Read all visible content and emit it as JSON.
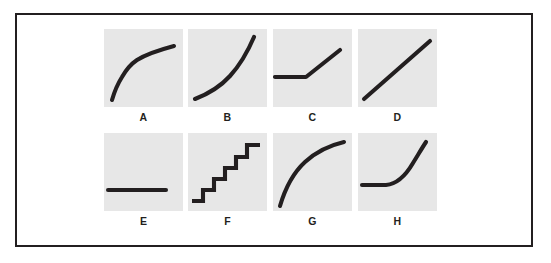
{
  "figure": {
    "background_color": "#ffffff",
    "frame_color": "#231f20",
    "panel_color": "#e7e7e7",
    "curve_color": "#231f20",
    "rows": 2,
    "columns": 4
  },
  "chart_data": {
    "type": "line",
    "title": "",
    "xlabel": "",
    "ylabel": "",
    "grid": false,
    "legend": "none",
    "panels": [
      {
        "id": "A",
        "label": "A",
        "shape": "concave-increasing-with-knee",
        "description": "Rises steeply from lower left, bends at a knee, then flattens toward the upper right.",
        "path": "M 8,71 C 10,64 13,56 18,48 C 22,41 27,35 33,31 C 41,26 55,21 70,17",
        "points": [
          [
            8,
            71
          ],
          [
            18,
            48
          ],
          [
            33,
            31
          ],
          [
            50,
            23
          ],
          [
            70,
            17
          ]
        ]
      },
      {
        "id": "B",
        "label": "B",
        "shape": "convex-exponential",
        "description": "Exponential growth: nearly flat at the lower left then sweeping sharply upward at the right.",
        "path": "M 7,70 C 20,65 32,58 42,47 C 52,36 60,22 66,8",
        "points": [
          [
            7,
            70
          ],
          [
            24,
            63
          ],
          [
            42,
            47
          ],
          [
            56,
            29
          ],
          [
            66,
            8
          ]
        ]
      },
      {
        "id": "C",
        "label": "C",
        "shape": "piecewise-hockey-stick",
        "description": "A flat horizontal segment that breaks into a straight rising diagonal: a hockey-stick kink.",
        "path": "M 2,48 L 33,48 L 67,21",
        "points": [
          [
            2,
            48
          ],
          [
            33,
            48
          ],
          [
            67,
            21
          ]
        ]
      },
      {
        "id": "D",
        "label": "D",
        "shape": "linear",
        "description": "A straight diagonal line rising at a constant slope from lower left to upper right.",
        "path": "M 6,70 L 72,12",
        "points": [
          [
            6,
            70
          ],
          [
            72,
            12
          ]
        ]
      },
      {
        "id": "E",
        "label": "E",
        "shape": "flat-constant",
        "description": "A flat horizontal line with no change, sitting in the lower middle of the panel.",
        "path": "M 4,57 L 62,57",
        "points": [
          [
            4,
            57
          ],
          [
            62,
            57
          ]
        ]
      },
      {
        "id": "F",
        "label": "F",
        "shape": "step-function",
        "description": "A staircase of discrete steps rising from lower left to upper right.",
        "steps": 6,
        "path": "M 4,68 L 15,68 L 15,57 L 26,57 L 26,46 L 37,46 L 37,35 L 48,35 L 48,24 L 59,24 L 59,12 L 72,12",
        "points": [
          [
            4,
            68
          ],
          [
            15,
            68
          ],
          [
            15,
            57
          ],
          [
            26,
            57
          ],
          [
            26,
            46
          ],
          [
            37,
            46
          ],
          [
            37,
            35
          ],
          [
            48,
            35
          ],
          [
            48,
            24
          ],
          [
            59,
            24
          ],
          [
            59,
            12
          ],
          [
            72,
            12
          ]
        ]
      },
      {
        "id": "G",
        "label": "G",
        "shape": "concave-logarithmic",
        "description": "Logarithmic growth: rises quickly at first then flattens as it reaches the upper right.",
        "path": "M 7,73 C 12,56 20,40 32,29 C 44,18 58,12 71,9",
        "points": [
          [
            7,
            73
          ],
          [
            18,
            45
          ],
          [
            32,
            29
          ],
          [
            50,
            16
          ],
          [
            71,
            9
          ]
        ]
      },
      {
        "id": "H",
        "label": "H",
        "shape": "flat-then-convex-rise",
        "description": "Flat along the left, then bending smoothly upward into a steep rise at the right.",
        "path": "M 4,52 L 28,52 C 40,51 48,42 55,30 C 60,22 64,15 68,9",
        "points": [
          [
            4,
            52
          ],
          [
            28,
            52
          ],
          [
            43,
            47
          ],
          [
            55,
            30
          ],
          [
            68,
            9
          ]
        ]
      }
    ]
  }
}
